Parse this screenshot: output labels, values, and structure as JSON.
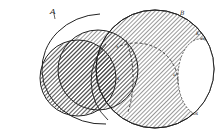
{
  "figure": {
    "type": "patent-style overlapping circles diagram",
    "labels": {
      "circle_a": "A",
      "circle_b": "B",
      "point_k": "K",
      "point_e": "e",
      "point_u": "u",
      "point_s": "s",
      "point_x": "x",
      "point_os": "os"
    },
    "colors": {
      "line": "#222222",
      "hatch": "#333333",
      "background": "#ffffff"
    }
  }
}
